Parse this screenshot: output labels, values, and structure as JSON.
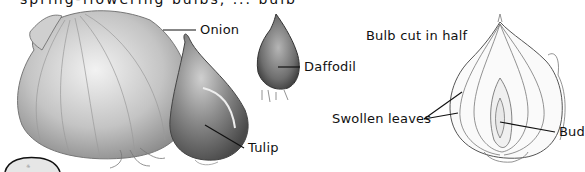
{
  "figure": {
    "top_cutoff_text": "spring-flowering bulbs, ... bulb",
    "labels": {
      "onion": "Onion",
      "daffodil": "Daffodil",
      "tulip": "Tulip",
      "bulb_cut": "Bulb cut in half",
      "swollen_leaves": "Swollen leaves",
      "bud": "Bud"
    },
    "colors": {
      "ink": "#111111",
      "bulb_gray": "#9a9a9a",
      "bulb_light": "#d8d8d8",
      "tulip_dark": "#6a6a6a"
    }
  }
}
